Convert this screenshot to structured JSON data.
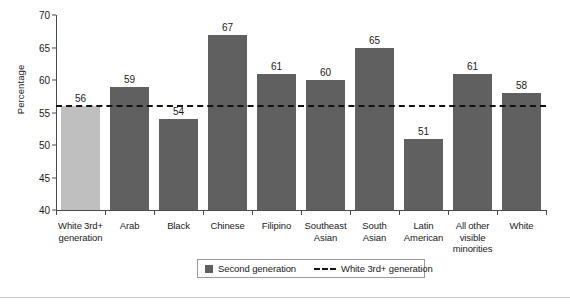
{
  "chart_data": {
    "type": "bar",
    "title": "",
    "xlabel": "",
    "ylabel": "Percentage",
    "ylim": [
      40,
      70
    ],
    "yticks": [
      40,
      45,
      50,
      55,
      60,
      65,
      70
    ],
    "grid": false,
    "legend_position": "bottom",
    "categories": [
      "White 3rd+ generation",
      "Arab",
      "Black",
      "Chinese",
      "Filipino",
      "Southeast Asian",
      "South Asian",
      "Latin American",
      "All other visible minorities",
      "White"
    ],
    "category_lines": [
      [
        "White 3rd+",
        "generation"
      ],
      [
        "Arab"
      ],
      [
        "Black"
      ],
      [
        "Chinese"
      ],
      [
        "Filipino"
      ],
      [
        "Southeast",
        "Asian"
      ],
      [
        "South",
        "Asian"
      ],
      [
        "Latin",
        "American"
      ],
      [
        "All other",
        "visible",
        "minorities"
      ],
      [
        "White"
      ]
    ],
    "values": [
      56,
      59,
      54,
      67,
      61,
      60,
      65,
      51,
      61,
      58
    ],
    "bar_colors": [
      "#bfbfbf",
      "#606060",
      "#606060",
      "#606060",
      "#606060",
      "#606060",
      "#606060",
      "#606060",
      "#606060",
      "#606060"
    ],
    "reference_line": {
      "label": "White 3rd+ generation",
      "value": 56,
      "style": "dashed",
      "color": "#121212"
    },
    "legend": [
      {
        "label": "Second generation",
        "marker": "square",
        "color": "#606060"
      },
      {
        "label": "White 3rd+ generation",
        "marker": "dashed-line",
        "color": "#121212"
      }
    ]
  }
}
